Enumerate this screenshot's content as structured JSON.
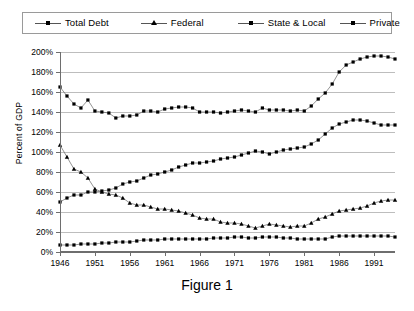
{
  "chart_data": {
    "type": "line",
    "title": "",
    "caption": "Figure 1",
    "xlabel": "",
    "ylabel": "Percent of GDP",
    "ylim": [
      0,
      200
    ],
    "xlim": [
      1946,
      1994
    ],
    "grid": true,
    "legend_position": "top",
    "ytick_labels": [
      "0%",
      "20%",
      "40%",
      "60%",
      "80%",
      "100%",
      "120%",
      "140%",
      "160%",
      "180%",
      "200%"
    ],
    "ytick_values": [
      0,
      20,
      40,
      60,
      80,
      100,
      120,
      140,
      160,
      180,
      200
    ],
    "xtick_labels": [
      "1946",
      "1951",
      "1956",
      "1961",
      "1966",
      "1971",
      "1976",
      "1981",
      "1986",
      "1991"
    ],
    "xtick_values": [
      1946,
      1951,
      1956,
      1961,
      1966,
      1971,
      1976,
      1981,
      1986,
      1991
    ],
    "x": [
      1946,
      1947,
      1948,
      1949,
      1950,
      1951,
      1952,
      1953,
      1954,
      1955,
      1956,
      1957,
      1958,
      1959,
      1960,
      1961,
      1962,
      1963,
      1964,
      1965,
      1966,
      1967,
      1968,
      1969,
      1970,
      1971,
      1972,
      1973,
      1974,
      1975,
      1976,
      1977,
      1978,
      1979,
      1980,
      1981,
      1982,
      1983,
      1984,
      1985,
      1986,
      1987,
      1988,
      1989,
      1990,
      1991,
      1992,
      1993,
      1994
    ],
    "series": [
      {
        "name": "Total Debt",
        "marker": "square",
        "values": [
          165,
          156,
          148,
          144,
          152,
          141,
          140,
          139,
          134,
          136,
          136,
          137,
          141,
          141,
          140,
          143,
          144,
          145,
          145,
          144,
          140,
          140,
          140,
          139,
          140,
          141,
          142,
          141,
          140,
          144,
          142,
          142,
          142,
          141,
          142,
          141,
          146,
          153,
          159,
          168,
          180,
          187,
          190,
          193,
          195,
          196,
          196,
          195,
          193
        ]
      },
      {
        "name": "Federal",
        "marker": "triangle",
        "values": [
          107,
          95,
          83,
          80,
          74,
          63,
          60,
          58,
          57,
          54,
          49,
          47,
          47,
          45,
          43,
          43,
          42,
          41,
          39,
          37,
          34,
          33,
          33,
          30,
          29,
          29,
          28,
          26,
          24,
          26,
          28,
          27,
          26,
          25,
          26,
          26,
          29,
          33,
          35,
          38,
          41,
          42,
          43,
          44,
          46,
          49,
          51,
          52,
          52
        ]
      },
      {
        "name": "State & Local",
        "marker": "square",
        "values": [
          7,
          7,
          7,
          8,
          8,
          8,
          9,
          9,
          10,
          10,
          10,
          11,
          12,
          12,
          12,
          13,
          13,
          13,
          13,
          13,
          13,
          13,
          14,
          14,
          14,
          15,
          15,
          14,
          14,
          15,
          15,
          15,
          14,
          14,
          13,
          13,
          13,
          13,
          13,
          15,
          16,
          16,
          16,
          16,
          16,
          16,
          16,
          16,
          15
        ]
      },
      {
        "name": "Private",
        "marker": "square",
        "values": [
          50,
          54,
          57,
          57,
          60,
          60,
          61,
          62,
          64,
          68,
          70,
          71,
          74,
          77,
          78,
          80,
          82,
          85,
          87,
          89,
          89,
          90,
          91,
          93,
          94,
          95,
          97,
          99,
          101,
          100,
          98,
          100,
          102,
          103,
          104,
          105,
          108,
          112,
          118,
          124,
          128,
          130,
          132,
          132,
          131,
          129,
          127,
          127,
          127
        ]
      }
    ]
  },
  "legend": {
    "items": [
      {
        "label": "Total Debt"
      },
      {
        "label": "Federal"
      },
      {
        "label": "State & Local"
      },
      {
        "label": "Private"
      }
    ]
  }
}
